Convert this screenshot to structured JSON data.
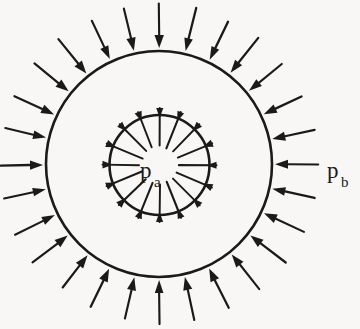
{
  "figure": {
    "background_color": "#f8f7f5",
    "ink_color": "#1a1a1a",
    "labels": {
      "inner_pressure": {
        "symbol": "p",
        "subscript": "a",
        "full": "p_a",
        "x": 140,
        "y": 178
      },
      "outer_pressure": {
        "symbol": "p",
        "subscript": "b",
        "full": "p_b",
        "x": 327,
        "y": 178
      }
    },
    "geometry": {
      "outer_circle": {
        "cx": 159,
        "cy": 164,
        "r": 113,
        "stroke_width": 2.6
      },
      "inner_circle": {
        "cx": 159.5,
        "cy": 165,
        "r": 50,
        "stroke_width": 2.6
      },
      "outer_arrows": {
        "count": 28,
        "start_offset": 46,
        "end_offset": 3,
        "head_length": 13,
        "head_width": 9,
        "shaft_width": 2.2,
        "angle_start_deg": -90
      },
      "inner_arrows": {
        "count": 16,
        "start_offset": 3,
        "end_offset": 31,
        "head_length": 10,
        "head_width": 7.5,
        "shaft_width": 2.0,
        "angle_start_deg": -90
      }
    }
  }
}
